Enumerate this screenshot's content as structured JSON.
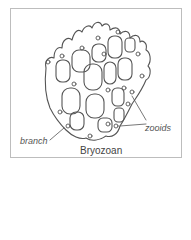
{
  "figure": {
    "title": "Bryozoan",
    "labels": {
      "branch": "branch",
      "zooids": "zooids"
    },
    "colors": {
      "line": "#555555",
      "frame": "#bdbdbd",
      "text": "#555555"
    }
  }
}
